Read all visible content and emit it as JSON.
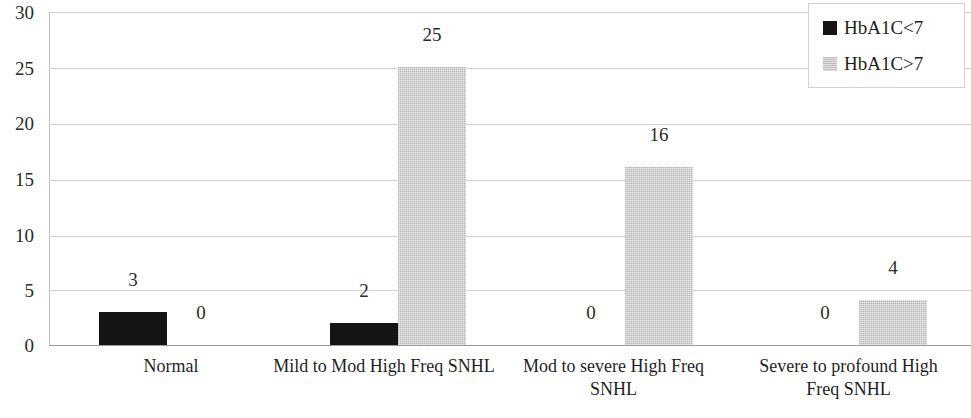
{
  "chart_data": {
    "type": "bar",
    "title": "",
    "subtitle": "",
    "xlabel": "",
    "ylabel": "",
    "categories": [
      "Normal",
      "Mild to Mod High Freq SNHL",
      "Mod to severe High Freq SNHL",
      "Severe to profound High Freq SNHL"
    ],
    "series": [
      {
        "name": "HbA1C<7",
        "color": "#141414",
        "values": [
          3,
          2,
          0,
          0
        ]
      },
      {
        "name": "HbA1C>7",
        "color": "#c9c9c9",
        "values": [
          0,
          25,
          16,
          4
        ]
      }
    ],
    "ylim": [
      0,
      30
    ],
    "yticks": [
      0,
      5,
      10,
      15,
      20,
      25,
      30
    ],
    "ytick_labels": [
      "0",
      "5",
      "10",
      "15",
      "20",
      "25",
      "30"
    ],
    "data_labels": [
      [
        "3",
        "0"
      ],
      [
        "2",
        "25"
      ],
      [
        "0",
        "16"
      ],
      [
        "0",
        "4"
      ]
    ],
    "grid": true,
    "legend_position": "top-right",
    "legend_entries": [
      "HbA1C<7",
      "HbA1C>7"
    ]
  },
  "axis": {
    "ticks": [
      {
        "label": "30",
        "top": 3
      },
      {
        "label": "25",
        "top": 59
      },
      {
        "label": "20",
        "top": 114
      },
      {
        "label": "15",
        "top": 170
      },
      {
        "label": "10",
        "top": 226
      },
      {
        "label": "5",
        "top": 281
      },
      {
        "label": "0",
        "top": 336
      }
    ]
  },
  "gridlines": [
    12,
    68,
    124,
    180,
    236,
    290,
    345
  ],
  "bars": [
    {
      "series": 0,
      "category": 0,
      "value": 3,
      "label": "3",
      "left": 50,
      "width": 68,
      "height": 33,
      "label_left": 50,
      "label_top": 270
    },
    {
      "series": 1,
      "category": 0,
      "value": 0,
      "label": "0",
      "left": 118,
      "width": 68,
      "height": 0,
      "label_left": 118,
      "label_top": 303
    },
    {
      "series": 0,
      "category": 1,
      "value": 2,
      "label": "2",
      "left": 281,
      "width": 68,
      "height": 22,
      "label_left": 281,
      "label_top": 281
    },
    {
      "series": 1,
      "category": 1,
      "value": 25,
      "label": "25",
      "left": 349,
      "width": 68,
      "height": 278,
      "label_left": 349,
      "label_top": 25
    },
    {
      "series": 0,
      "category": 2,
      "value": 0,
      "label": "0",
      "left": 508,
      "width": 68,
      "height": 0,
      "label_left": 508,
      "label_top": 303
    },
    {
      "series": 1,
      "category": 2,
      "value": 16,
      "label": "16",
      "left": 576,
      "width": 68,
      "height": 178,
      "label_left": 576,
      "label_top": 125
    },
    {
      "series": 0,
      "category": 3,
      "value": 0,
      "label": "0",
      "left": 742,
      "width": 68,
      "height": 0,
      "label_left": 742,
      "label_top": 303
    },
    {
      "series": 1,
      "category": 3,
      "value": 4,
      "label": "4",
      "left": 810,
      "width": 68,
      "height": 45,
      "label_left": 810,
      "label_top": 258
    }
  ],
  "category_labels": [
    {
      "text": "Normal",
      "left": 71,
      "width": 200
    },
    {
      "text": "Mild to Mod High Freq SNHL",
      "left": 268,
      "width": 232
    },
    {
      "text": "Mod to severe High Freq SNHL",
      "left": 511,
      "width": 205
    },
    {
      "text": "Severe to profound High Freq SNHL",
      "left": 746,
      "width": 205
    }
  ],
  "legend": {
    "rows": [
      {
        "label": "HbA1C<7",
        "swatch": "black"
      },
      {
        "label": "HbA1C>7",
        "swatch": "gray"
      }
    ]
  }
}
